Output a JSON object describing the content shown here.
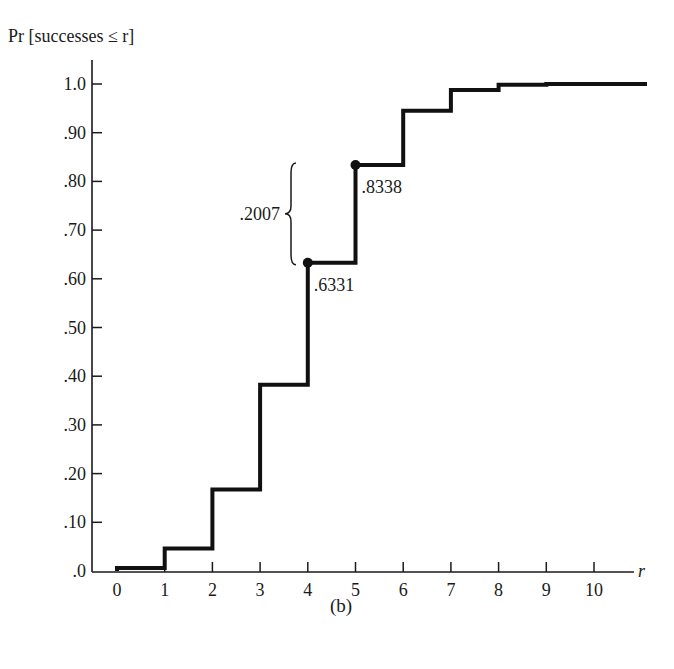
{
  "chart_data": {
    "type": "line",
    "subtype": "step-cdf",
    "title": "",
    "panel_label": "(b)",
    "ylabel": "Pr [successes ≤ r]",
    "xlabel": "r",
    "x": [
      0,
      1,
      2,
      3,
      4,
      5,
      6,
      7,
      8,
      9,
      10
    ],
    "series": [
      {
        "name": "Pr [successes ≤ r]",
        "values": [
          0.006,
          0.0464,
          0.1673,
          0.3823,
          0.6331,
          0.8338,
          0.9452,
          0.9877,
          0.9983,
          0.9999,
          1.0
        ]
      }
    ],
    "xlim": [
      0,
      11
    ],
    "ylim": [
      0,
      1.0
    ],
    "x_ticks": [
      "0",
      "1",
      "2",
      "3",
      "4",
      "5",
      "6",
      "7",
      "8",
      "9",
      "10"
    ],
    "y_ticks": [
      ".0",
      ".10",
      ".20",
      ".30",
      ".40",
      ".50",
      ".60",
      ".70",
      ".80",
      ".90",
      "1.0"
    ],
    "y_tick_values": [
      0,
      0.1,
      0.2,
      0.3,
      0.4,
      0.5,
      0.6,
      0.7,
      0.8,
      0.9,
      1.0
    ],
    "grid": false,
    "legend": "none",
    "annotations": [
      {
        "type": "point-label",
        "x": 4,
        "y": 0.6331,
        "text": ".6331"
      },
      {
        "type": "point-label",
        "x": 5,
        "y": 0.8338,
        "text": ".8338"
      },
      {
        "type": "brace",
        "from": 0.6331,
        "to": 0.8338,
        "text": ".2007"
      }
    ],
    "color": "#111111"
  }
}
